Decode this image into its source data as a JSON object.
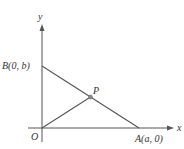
{
  "figure": {
    "type": "coordinate-geometry-diagram",
    "axes": {
      "x_label": "x",
      "y_label": "y",
      "origin_label": "O"
    },
    "points": {
      "A": {
        "label": "A(a, 0)",
        "coords": [
          "a",
          "0"
        ]
      },
      "B": {
        "label": "B(0, b)",
        "coords": [
          "0",
          "b"
        ]
      },
      "P": {
        "label": "P",
        "description": "midpoint of AB"
      },
      "O": {
        "label": "O",
        "coords": [
          "0",
          "0"
        ]
      }
    },
    "segments": [
      {
        "from": "A",
        "to": "B"
      },
      {
        "from": "O",
        "to": "P"
      }
    ],
    "colors": {
      "line": "#555555",
      "point_fill": "#888888",
      "text": "#333333",
      "background": "#ffffff"
    }
  }
}
